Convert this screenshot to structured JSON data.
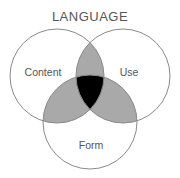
{
  "title": "LANGUAGE",
  "circles": [
    {
      "id": "content",
      "label": "Content",
      "cx": 57,
      "cy": 76,
      "r": 47
    },
    {
      "id": "use",
      "label": "Use",
      "cx": 123,
      "cy": 76,
      "r": 47
    },
    {
      "id": "form",
      "label": "Form",
      "cx": 90,
      "cy": 122,
      "r": 47
    }
  ],
  "colors": {
    "stroke": "#8a8a8a",
    "pairwise_overlap": "#a9a9a9",
    "triple_overlap": "#000000",
    "text": "#555555",
    "background": "#ffffff"
  }
}
